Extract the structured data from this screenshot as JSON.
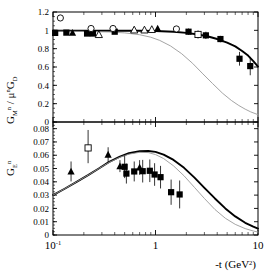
{
  "figure": {
    "width": 269,
    "height": 274,
    "background": "#ffffff",
    "xaxis": {
      "label_parts": {
        "prefix": "-t (GeV",
        "sup": "2",
        "suffix": ")"
      },
      "label_text": "-t (GeV2)",
      "scale": "log",
      "min": 0.1,
      "max": 10,
      "tick_labels": [
        {
          "value": 0.1,
          "text": "10",
          "sup": "-1"
        },
        {
          "value": 1,
          "text": "1",
          "sup": ""
        },
        {
          "value": 10,
          "text": "10",
          "sup": ""
        }
      ]
    },
    "colors": {
      "curve_main": "#000000",
      "curve_secondary": "#9a9a9a",
      "marker_filled": "#000000",
      "marker_open_edge": "#000000",
      "marker_open_fill": "#ffffff",
      "frame": "#000000"
    }
  },
  "chart_data": [
    {
      "id": "top-panel",
      "type": "scatter",
      "title": "",
      "xlabel": "-t (GeV^2)",
      "ylabel": "G_M^n / mu^n G_D",
      "ylabel_parts": {
        "g": "G",
        "gsub": "M",
        "gsup": "n",
        "slash": " / ",
        "mu": "μ",
        "musup": "n",
        "g2": "G",
        "g2sub": "D"
      },
      "xscale": "log",
      "xlim": [
        0.1,
        10
      ],
      "ylim": [
        0,
        1.2
      ],
      "ytick_labels": [
        "1.2",
        "1",
        "0.8",
        "0.6",
        "0.4",
        "0.2",
        "0"
      ],
      "ytick_values": [
        1.2,
        1.0,
        0.8,
        0.6,
        0.4,
        0.2,
        0.0
      ],
      "grid": false,
      "legend": "none",
      "series": [
        {
          "name": "filled-squares",
          "marker": "filled-square",
          "points": [
            {
              "x": 0.105,
              "y": 0.972,
              "eyl": 0.02,
              "eyh": 0.02
            },
            {
              "x": 0.135,
              "y": 0.975,
              "eyl": 0.02,
              "eyh": 0.02
            },
            {
              "x": 0.215,
              "y": 0.965,
              "eyl": 0.025,
              "eyh": 0.025
            },
            {
              "x": 0.245,
              "y": 0.965,
              "eyl": 0.025,
              "eyh": 0.025
            },
            {
              "x": 0.4,
              "y": 0.985,
              "eyl": 0.02,
              "eyh": 0.02
            },
            {
              "x": 2.1,
              "y": 0.985,
              "eyl": 0.035,
              "eyh": 0.035
            },
            {
              "x": 3.1,
              "y": 0.945,
              "eyl": 0.04,
              "eyh": 0.04
            },
            {
              "x": 4.3,
              "y": 0.905,
              "eyl": 0.035,
              "eyh": 0.035
            },
            {
              "x": 6.6,
              "y": 0.69,
              "eyl": 0.075,
              "eyh": 0.075
            },
            {
              "x": 8.4,
              "y": 0.61,
              "eyl": 0.1,
              "eyh": 0.1
            }
          ]
        },
        {
          "name": "filled-triangles",
          "marker": "filled-triangle",
          "points": [
            {
              "x": 0.155,
              "y": 0.975,
              "eyl": 0.015,
              "eyh": 0.015
            },
            {
              "x": 1.05,
              "y": 1.02,
              "eyl": 0.02,
              "eyh": 0.02
            }
          ]
        },
        {
          "name": "open-circles",
          "marker": "open-circle",
          "points": [
            {
              "x": 0.118,
              "y": 1.135,
              "eyl": 0.0,
              "eyh": 0.0
            },
            {
              "x": 0.235,
              "y": 1.02,
              "eyl": 0.0,
              "eyh": 0.0
            },
            {
              "x": 0.385,
              "y": 1.02,
              "eyl": 0.0,
              "eyh": 0.0
            },
            {
              "x": 1.6,
              "y": 1.015,
              "eyl": 0.0,
              "eyh": 0.0
            }
          ]
        },
        {
          "name": "open-squares",
          "marker": "open-square",
          "points": [
            {
              "x": 2.6,
              "y": 0.955,
              "eyl": 0.045,
              "eyh": 0.045
            }
          ]
        },
        {
          "name": "open-triangles",
          "marker": "open-triangle",
          "points": [
            {
              "x": 0.28,
              "y": 0.955,
              "eyl": 0.0,
              "eyh": 0.0
            },
            {
              "x": 0.62,
              "y": 1.005,
              "eyl": 0.0,
              "eyh": 0.0
            },
            {
              "x": 0.78,
              "y": 1.005,
              "eyl": 0.0,
              "eyh": 0.0
            },
            {
              "x": 0.92,
              "y": 1.01,
              "eyl": 0.0,
              "eyh": 0.0
            }
          ]
        }
      ],
      "curves": [
        {
          "name": "main-curve",
          "style": "thick-solid-black",
          "points": [
            [
              0.1,
              0.995
            ],
            [
              0.2,
              0.995
            ],
            [
              0.4,
              0.995
            ],
            [
              0.7,
              0.995
            ],
            [
              1.0,
              0.993
            ],
            [
              1.5,
              0.985
            ],
            [
              2.0,
              0.972
            ],
            [
              2.6,
              0.955
            ],
            [
              3.2,
              0.935
            ],
            [
              4.0,
              0.905
            ],
            [
              5.0,
              0.865
            ],
            [
              6.0,
              0.825
            ],
            [
              7.0,
              0.775
            ],
            [
              8.0,
              0.725
            ],
            [
              9.0,
              0.665
            ],
            [
              10.0,
              0.605
            ]
          ]
        },
        {
          "name": "secondary-curve",
          "style": "thin-solid-gray",
          "points": [
            [
              0.1,
              0.99
            ],
            [
              0.2,
              0.988
            ],
            [
              0.35,
              0.982
            ],
            [
              0.5,
              0.972
            ],
            [
              0.7,
              0.952
            ],
            [
              0.9,
              0.925
            ],
            [
              1.1,
              0.89
            ],
            [
              1.4,
              0.83
            ],
            [
              1.8,
              0.745
            ],
            [
              2.3,
              0.64
            ],
            [
              2.9,
              0.525
            ],
            [
              3.6,
              0.42
            ],
            [
              4.5,
              0.315
            ],
            [
              5.5,
              0.235
            ],
            [
              6.5,
              0.18
            ],
            [
              7.5,
              0.14
            ],
            [
              8.5,
              0.11
            ],
            [
              10.0,
              0.08
            ]
          ]
        }
      ]
    },
    {
      "id": "bottom-panel",
      "type": "scatter",
      "title": "",
      "xlabel": "-t (GeV^2)",
      "ylabel": "G_E^n",
      "ylabel_parts": {
        "g": "G",
        "gsub": "E",
        "gsup": "n"
      },
      "xscale": "log",
      "xlim": [
        0.1,
        10
      ],
      "ylim": [
        0,
        0.085
      ],
      "ytick_labels": [
        "0.08",
        "0.07",
        "0.06",
        "0.05",
        "0.04",
        "0.03",
        "0.02",
        "0.01",
        "0"
      ],
      "ytick_values": [
        0.08,
        0.07,
        0.06,
        0.05,
        0.04,
        0.03,
        0.02,
        0.01,
        0.0
      ],
      "grid": false,
      "legend": "none",
      "series": [
        {
          "name": "filled-triangles",
          "marker": "filled-triangle",
          "points": [
            {
              "x": 0.15,
              "y": 0.0478,
              "eyl": 0.0075,
              "eyh": 0.0075
            },
            {
              "x": 0.345,
              "y": 0.0605,
              "eyl": 0.0055,
              "eyh": 0.0055
            },
            {
              "x": 0.45,
              "y": 0.0518,
              "eyl": 0.0045,
              "eyh": 0.0045
            },
            {
              "x": 0.7,
              "y": 0.0508,
              "eyl": 0.0055,
              "eyh": 0.0055
            }
          ]
        },
        {
          "name": "open-squares",
          "marker": "open-square",
          "points": [
            {
              "x": 0.22,
              "y": 0.0655,
              "eyl": 0.0115,
              "eyh": 0.0135
            }
          ]
        },
        {
          "name": "filled-squares",
          "marker": "filled-square",
          "points": [
            {
              "x": 0.5,
              "y": 0.0513,
              "eyl": 0.0085,
              "eyh": 0.0085
            },
            {
              "x": 0.52,
              "y": 0.0462,
              "eyl": 0.0075,
              "eyh": 0.0075
            },
            {
              "x": 0.62,
              "y": 0.0478,
              "eyl": 0.0075,
              "eyh": 0.0075
            },
            {
              "x": 0.75,
              "y": 0.048,
              "eyl": 0.0085,
              "eyh": 0.0085
            },
            {
              "x": 0.88,
              "y": 0.0483,
              "eyl": 0.0085,
              "eyh": 0.0085
            },
            {
              "x": 0.98,
              "y": 0.0455,
              "eyl": 0.0085,
              "eyh": 0.0085
            },
            {
              "x": 1.12,
              "y": 0.0435,
              "eyl": 0.0085,
              "eyh": 0.0085
            },
            {
              "x": 1.42,
              "y": 0.0322,
              "eyl": 0.0095,
              "eyh": 0.0095
            },
            {
              "x": 1.72,
              "y": 0.0305,
              "eyl": 0.0105,
              "eyh": 0.0105
            }
          ]
        }
      ],
      "curves": [
        {
          "name": "main-curve",
          "style": "thick-solid-black",
          "points": [
            [
              0.1,
              0.03
            ],
            [
              0.13,
              0.0348
            ],
            [
              0.17,
              0.04
            ],
            [
              0.22,
              0.045
            ],
            [
              0.28,
              0.05
            ],
            [
              0.35,
              0.0548
            ],
            [
              0.45,
              0.059
            ],
            [
              0.55,
              0.0615
            ],
            [
              0.7,
              0.063
            ],
            [
              0.85,
              0.0632
            ],
            [
              1.0,
              0.0625
            ],
            [
              1.2,
              0.0605
            ],
            [
              1.5,
              0.0565
            ],
            [
              1.9,
              0.0505
            ],
            [
              2.4,
              0.0432
            ],
            [
              3.0,
              0.0355
            ],
            [
              3.8,
              0.0275
            ],
            [
              4.8,
              0.02
            ],
            [
              6.0,
              0.014
            ],
            [
              7.5,
              0.0092
            ],
            [
              9.0,
              0.0063
            ],
            [
              10.0,
              0.0048
            ]
          ]
        },
        {
          "name": "secondary-curve",
          "style": "thin-solid-gray",
          "points": [
            [
              0.1,
              0.03
            ],
            [
              0.13,
              0.0348
            ],
            [
              0.17,
              0.04
            ],
            [
              0.22,
              0.045
            ],
            [
              0.28,
              0.05
            ],
            [
              0.35,
              0.0545
            ],
            [
              0.45,
              0.0585
            ],
            [
              0.55,
              0.0608
            ],
            [
              0.7,
              0.0622
            ],
            [
              0.85,
              0.062
            ],
            [
              1.0,
              0.0605
            ],
            [
              1.2,
              0.0575
            ],
            [
              1.5,
              0.052
            ],
            [
              1.9,
              0.0445
            ],
            [
              2.4,
              0.0358
            ],
            [
              3.0,
              0.0275
            ],
            [
              3.8,
              0.0192
            ],
            [
              4.8,
              0.0126
            ],
            [
              6.0,
              0.008
            ],
            [
              7.5,
              0.0048
            ],
            [
              9.0,
              0.003
            ],
            [
              10.0,
              0.0022
            ]
          ]
        }
      ]
    }
  ]
}
